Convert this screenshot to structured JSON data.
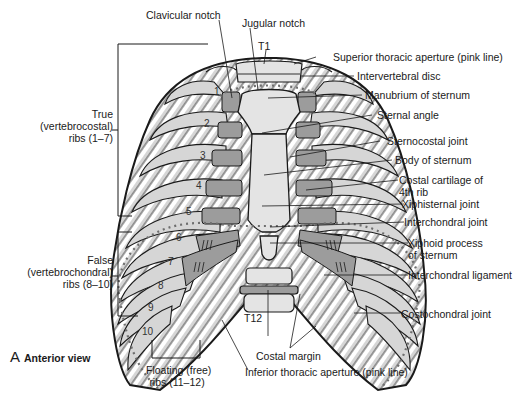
{
  "figure": {
    "caption_letter": "A",
    "caption_text": "Anterior view",
    "colors": {
      "bone": "#d6d6d6",
      "cartilage": "#9c9c9c",
      "outline": "#1a1a1a",
      "aperture_dots": "#6e6e6e",
      "background": "#ffffff"
    }
  },
  "labels": {
    "top": {
      "clavicular_notch": "Clavicular notch",
      "jugular_notch": "Jugular notch",
      "t1": "T1"
    },
    "right": {
      "superior_thoracic_aperture": "Superior thoracic aperture (pink line)",
      "intervertebral_disc": "Intervertebral disc",
      "manubrium": "Manubrium of sternum",
      "sternal_angle": "Sternal angle",
      "sternocostal_joint": "Sternocostal joint",
      "body_of_sternum": "Body of sternum",
      "costal_cartilage_line1": "Costal cartilage of",
      "costal_cartilage_line2": "4th rib",
      "xiphisternal_joint": "Xiphisternal joint",
      "interchondral_joint": "Interchondral joint",
      "xiphoid_line1": "Xiphoid process",
      "xiphoid_line2": "of sternum",
      "interchondral_ligament": "Interchondral ligament",
      "costochondral_joint": "Costochondral joint"
    },
    "left": {
      "true_line1": "True",
      "true_line2": "(vertebrocostal)",
      "true_line3": "ribs (1–7)",
      "false_line1": "False",
      "false_line2": "(vertebrochondral)",
      "false_line3": "ribs (8–10)"
    },
    "bottom": {
      "t12": "T12",
      "costal_margin": "Costal margin",
      "floating_line1": "Floating (free)",
      "floating_line2": "ribs (11–12)",
      "inferior_thoracic_aperture": "Inferior thoracic aperture (pink line)"
    },
    "rib_numbers": [
      "1",
      "2",
      "3",
      "4",
      "5",
      "6",
      "7",
      "8",
      "9",
      "10",
      "11",
      "12"
    ]
  }
}
